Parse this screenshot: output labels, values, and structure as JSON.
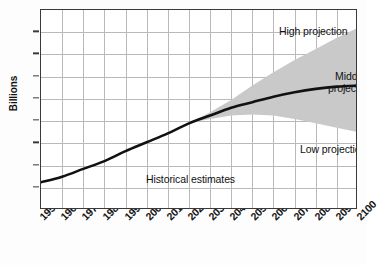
{
  "chart_data": {
    "type": "line",
    "title": "",
    "xlabel": "",
    "ylabel": "Billions",
    "xlim": [
      1950,
      2100
    ],
    "ylim": [
      0,
      18
    ],
    "grid": true,
    "legend_position": "in-plot annotations",
    "xticks": [
      "1950",
      "1960",
      "1970",
      "1980",
      "1990",
      "2000",
      "2010",
      "2020",
      "2030",
      "2040",
      "2050",
      "2060",
      "2070",
      "2080",
      "2090",
      "2100"
    ],
    "yticks": [
      "0",
      "2",
      "4",
      "6",
      "8",
      "10",
      "12",
      "14",
      "16",
      "18"
    ],
    "x": [
      1950,
      1960,
      1970,
      1980,
      1990,
      2000,
      2010,
      2020,
      2030,
      2040,
      2050,
      2060,
      2070,
      2080,
      2090,
      2100
    ],
    "series": [
      {
        "name": "Historical estimates",
        "values": [
          2.5,
          3.0,
          3.7,
          4.4,
          5.3,
          6.1,
          6.9,
          7.8,
          null,
          null,
          null,
          null,
          null,
          null,
          null,
          null
        ]
      },
      {
        "name": "Middle projection",
        "values": [
          null,
          null,
          null,
          null,
          null,
          null,
          null,
          7.8,
          8.5,
          9.2,
          9.7,
          10.2,
          10.6,
          10.9,
          11.1,
          11.2
        ]
      },
      {
        "name": "High projection",
        "values": [
          null,
          null,
          null,
          null,
          null,
          null,
          null,
          7.8,
          8.8,
          9.9,
          11.2,
          12.4,
          13.5,
          14.5,
          15.5,
          16.4
        ]
      },
      {
        "name": "Low projection",
        "values": [
          null,
          null,
          null,
          null,
          null,
          null,
          null,
          7.8,
          8.2,
          8.5,
          8.6,
          8.5,
          8.2,
          7.8,
          7.4,
          7.0
        ]
      }
    ],
    "annotations": [
      {
        "id": "high",
        "text": "High projection"
      },
      {
        "id": "middle",
        "text": "Middle",
        "text2": "projection"
      },
      {
        "id": "low",
        "text": "Low projection"
      },
      {
        "id": "historical",
        "text": "Historical estimates"
      }
    ],
    "colors": {
      "line": "#111111",
      "band": "#c9c9c9",
      "grid": "#b9b9b9",
      "axis": "#3a3a3a",
      "background": "#ffffff"
    }
  }
}
